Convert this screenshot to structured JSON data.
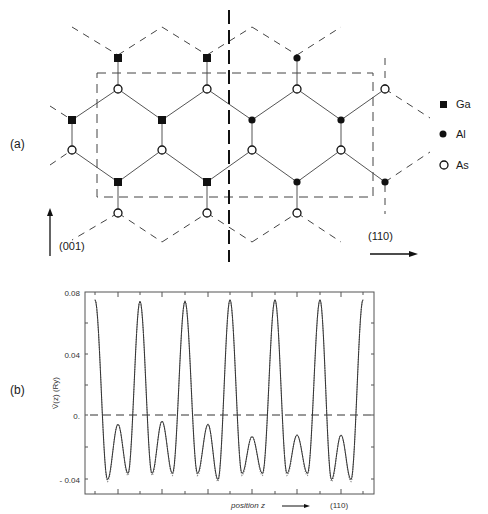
{
  "figure": {
    "panel_a": {
      "label": "(a)",
      "legend": [
        {
          "symbol": "filled-square",
          "label": "Ga"
        },
        {
          "symbol": "filled-circle",
          "label": "Al"
        },
        {
          "symbol": "open-circle",
          "label": "As"
        }
      ],
      "axis_vertical_label": "(001)",
      "axis_horizontal_label": "(110)",
      "atoms": {
        "Ga": [
          [
            118,
            58
          ],
          [
            207,
            58
          ],
          [
            72,
            120
          ],
          [
            162,
            120
          ],
          [
            118,
            182
          ],
          [
            207,
            182
          ]
        ],
        "Al": [
          [
            297,
            58
          ],
          [
            252,
            120
          ],
          [
            341,
            120
          ],
          [
            297,
            182
          ],
          [
            385,
            182
          ]
        ],
        "As": [
          [
            118,
            89
          ],
          [
            207,
            89
          ],
          [
            297,
            89
          ],
          [
            385,
            89
          ],
          [
            72,
            150
          ],
          [
            162,
            150
          ],
          [
            252,
            150
          ],
          [
            341,
            150
          ],
          [
            118,
            213
          ],
          [
            207,
            213
          ],
          [
            297,
            213
          ]
        ]
      },
      "unit_cell_box": {
        "x1": 97,
        "y1": 73,
        "x2": 373,
        "y2": 197
      },
      "interface_line_x": 229
    },
    "panel_b": {
      "label": "(b)",
      "ylabel": "V̄(z) (Ry)",
      "xlabel": "position z",
      "x_direction": "(110)",
      "yticks": [
        "0.08",
        "0.04",
        "0.",
        "- 0.04"
      ]
    }
  },
  "chart_data": {
    "type": "line",
    "title": "",
    "xlabel": "position z (110)",
    "ylabel": "V̄(z) (Ry)",
    "ylim": [
      -0.05,
      0.08
    ],
    "yticks": [
      0.08,
      0.04,
      0.0,
      -0.04
    ],
    "grid": false,
    "legend": "none",
    "reference_line": {
      "y": 0.0,
      "style": "dashed"
    },
    "series": [
      {
        "name": "V(z) solid",
        "style": "solid",
        "x": [
          0,
          0.5,
          1,
          1.5,
          2,
          2.5,
          3,
          3.5,
          4,
          4.5,
          5,
          5.5,
          6,
          6.5,
          7,
          7.5,
          8,
          8.5,
          9,
          9.5,
          10,
          10.5,
          11,
          11.5,
          12,
          12.5,
          13,
          13.5,
          14,
          14.5,
          15,
          15.5,
          16,
          16.5,
          17,
          17.5,
          18,
          18.5,
          19,
          19.5,
          20,
          20.5,
          21
        ],
        "values": [
          0.075,
          0.01,
          -0.042,
          -0.025,
          -0.006,
          -0.025,
          -0.038,
          0.01,
          0.075,
          0.01,
          -0.038,
          -0.02,
          -0.004,
          -0.02,
          -0.038,
          0.01,
          0.075,
          0.01,
          -0.038,
          -0.025,
          -0.006,
          -0.025,
          -0.042,
          0.01,
          0.075,
          0.01,
          -0.038,
          -0.025,
          -0.014,
          -0.025,
          -0.038,
          0.01,
          0.075,
          0.01,
          -0.038,
          -0.025,
          -0.013,
          -0.025,
          -0.039,
          0.01,
          0.075,
          0.01,
          -0.038
        ]
      },
      {
        "name": "V(z) dotted",
        "style": "dotted",
        "note": "nearly coincident with solid curve; deviates slightly near minima"
      }
    ],
    "peaks": [
      {
        "x_px": 95,
        "y": 0.075
      },
      {
        "x_px": 140,
        "y": 0.074
      },
      {
        "x_px": 185,
        "y": 0.074
      },
      {
        "x_px": 230,
        "y": 0.075
      },
      {
        "x_px": 275,
        "y": 0.075
      },
      {
        "x_px": 320,
        "y": 0.075
      },
      {
        "x_px": 363,
        "y": 0.075
      }
    ],
    "secondary_peaks": [
      {
        "x_px": 118,
        "y": -0.006
      },
      {
        "x_px": 162,
        "y": -0.004
      },
      {
        "x_px": 208,
        "y": -0.006
      },
      {
        "x_px": 252,
        "y": -0.014
      },
      {
        "x_px": 297,
        "y": -0.013
      },
      {
        "x_px": 341,
        "y": -0.013
      }
    ]
  }
}
